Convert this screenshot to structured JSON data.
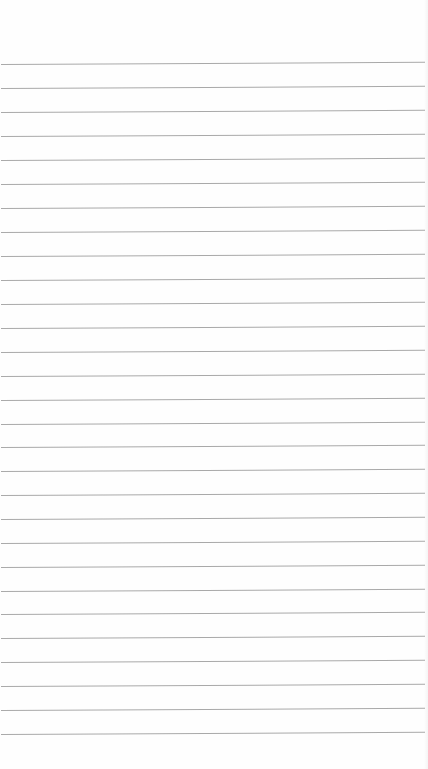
{
  "page": {
    "kind": "blank lined notebook paper",
    "background_color": "#fefefe",
    "rule_color": "#a9a9a9",
    "rule_count": 29,
    "rule_positions_y": [
      64,
      88,
      112,
      136,
      160,
      184,
      208,
      232,
      256,
      280,
      304,
      328,
      352,
      376,
      400,
      424,
      447,
      471,
      495,
      519,
      543,
      567,
      591,
      614,
      638,
      662,
      686,
      710,
      734
    ],
    "rule_left_x": 1,
    "rule_right_x": 425
  }
}
